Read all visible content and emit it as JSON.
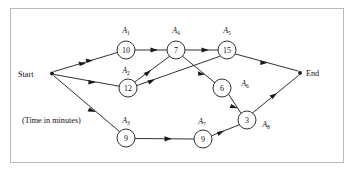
{
  "figure": {
    "caption": "(Time in minutes)",
    "start_label": "Start",
    "end_label": "End",
    "frame_color": "#b9b9b9",
    "line_color": "#1a1a1a",
    "node_fill": "#ffffff",
    "background": "#ffffff"
  },
  "graph_data": {
    "type": "diagram",
    "diagram_kind": "activity-network",
    "title": "",
    "units": "minutes",
    "nodes": [
      {
        "id": "start",
        "label": "Start",
        "kind": "terminal",
        "x": 51,
        "y": 73
      },
      {
        "id": "n1",
        "label": "10",
        "activity": "A1",
        "duration": 10,
        "kind": "activity",
        "x": 126,
        "y": 50,
        "r": 9
      },
      {
        "id": "n4",
        "label": "7",
        "activity": "A4",
        "duration": 7,
        "kind": "activity",
        "x": 176,
        "y": 50,
        "r": 9
      },
      {
        "id": "n5",
        "label": "15",
        "activity": "A5",
        "duration": 15,
        "kind": "activity",
        "x": 227,
        "y": 50,
        "r": 9
      },
      {
        "id": "n2",
        "label": "12",
        "activity": "A2",
        "duration": 12,
        "kind": "activity",
        "x": 128,
        "y": 88,
        "r": 9
      },
      {
        "id": "n6",
        "label": "6",
        "activity": "A6",
        "duration": 6,
        "kind": "activity",
        "x": 222,
        "y": 88,
        "r": 9
      },
      {
        "id": "n8",
        "label": "3",
        "activity": "A8",
        "duration": 3,
        "kind": "activity",
        "x": 247,
        "y": 120,
        "r": 9
      },
      {
        "id": "n3",
        "label": "9",
        "activity": "A3",
        "duration": 9,
        "kind": "activity",
        "x": 126,
        "y": 138,
        "r": 9
      },
      {
        "id": "n7",
        "label": "9",
        "activity": "A7",
        "duration": 9,
        "kind": "activity",
        "x": 203,
        "y": 139,
        "r": 9
      },
      {
        "id": "end",
        "label": "End",
        "kind": "terminal",
        "x": 300,
        "y": 73
      }
    ],
    "edges": [
      {
        "from": "start",
        "to": "n1"
      },
      {
        "from": "start",
        "to": "n2"
      },
      {
        "from": "start",
        "to": "n3"
      },
      {
        "from": "n1",
        "to": "n4"
      },
      {
        "from": "n4",
        "to": "n5"
      },
      {
        "from": "n2",
        "to": "n4"
      },
      {
        "from": "n2",
        "to": "n5"
      },
      {
        "from": "n4",
        "to": "n6"
      },
      {
        "from": "n5",
        "to": "end"
      },
      {
        "from": "n6",
        "to": "n8"
      },
      {
        "from": "n3",
        "to": "n7"
      },
      {
        "from": "n7",
        "to": "n8"
      },
      {
        "from": "n8",
        "to": "end"
      }
    ],
    "activity_labels": [
      {
        "name": "A",
        "sub": "1",
        "x": 126,
        "y": 32
      },
      {
        "name": "A",
        "sub": "4",
        "x": 176,
        "y": 32
      },
      {
        "name": "A",
        "sub": "5",
        "x": 227,
        "y": 32
      },
      {
        "name": "A",
        "sub": "2",
        "x": 126,
        "y": 71
      },
      {
        "name": "A",
        "sub": "6",
        "x": 245,
        "y": 84
      },
      {
        "name": "A",
        "sub": "3",
        "x": 126,
        "y": 122
      },
      {
        "name": "A",
        "sub": "7",
        "x": 202,
        "y": 122
      },
      {
        "name": "A",
        "sub": "8",
        "x": 266,
        "y": 126
      }
    ]
  }
}
